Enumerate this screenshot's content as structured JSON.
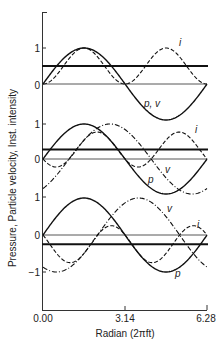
{
  "chart_data": {
    "type": "line",
    "title": "",
    "xlabel": "Radian (2πft)",
    "ylabel": "Pressure, Particle velocity, Inst. intensity",
    "xlim": [
      0,
      6.28
    ],
    "x_ticks": [
      "0.00",
      "3.14",
      "6.28"
    ],
    "grid": false,
    "legend": "inline labels",
    "panels": [
      {
        "name": "in-phase",
        "phase_rad": 0.0,
        "y_ticks": [
          "1",
          "0"
        ],
        "series": [
          {
            "name": "p, v",
            "style": "solid",
            "formula": "sin(x)",
            "label": "p, v"
          },
          {
            "name": "i",
            "style": "dashed",
            "formula": "sin(x)*sin(x)",
            "label": "i"
          }
        ],
        "mean_intensity": 0.5
      },
      {
        "name": "partial-phase",
        "phase_rad": 1.0,
        "y_ticks": [
          "1",
          "0"
        ],
        "series": [
          {
            "name": "p",
            "style": "solid",
            "formula": "sin(x)",
            "label": "p"
          },
          {
            "name": "v",
            "style": "dashdot",
            "formula": "sin(x - 1.0)",
            "label": "v"
          },
          {
            "name": "i",
            "style": "dashed",
            "formula": "sin(x)*sin(x - 1.0)",
            "label": "i"
          }
        ],
        "mean_intensity": 0.27
      },
      {
        "name": "large-phase",
        "phase_rad": 2.09,
        "y_ticks": [
          "1",
          "0",
          "−1"
        ],
        "series": [
          {
            "name": "p",
            "style": "solid",
            "formula": "sin(x)",
            "label": "p"
          },
          {
            "name": "v",
            "style": "dashdot",
            "formula": "sin(x - 2.09)",
            "label": "v"
          },
          {
            "name": "i",
            "style": "dashed",
            "formula": "sin(x)*sin(x - 2.09)",
            "label": "i"
          }
        ],
        "mean_intensity": -0.25
      }
    ]
  },
  "labels": {
    "xlabel": "Radian (2πft)",
    "ylabel": "Pressure, Particle velocity, Inst. intensity",
    "xtick0": "0.00",
    "xtick1": "3.14",
    "xtick2": "6.28",
    "top_y1": "1",
    "top_y0": "0",
    "mid_y1": "1",
    "mid_y0": "0",
    "bot_y1": "1",
    "bot_y0": "0",
    "bot_ym1": "−1",
    "top_i": "i",
    "top_pv": "p, v",
    "mid_i": "i",
    "mid_v": "v",
    "mid_p": "p",
    "bot_v": "v",
    "bot_i": "i",
    "bot_p": "p"
  }
}
